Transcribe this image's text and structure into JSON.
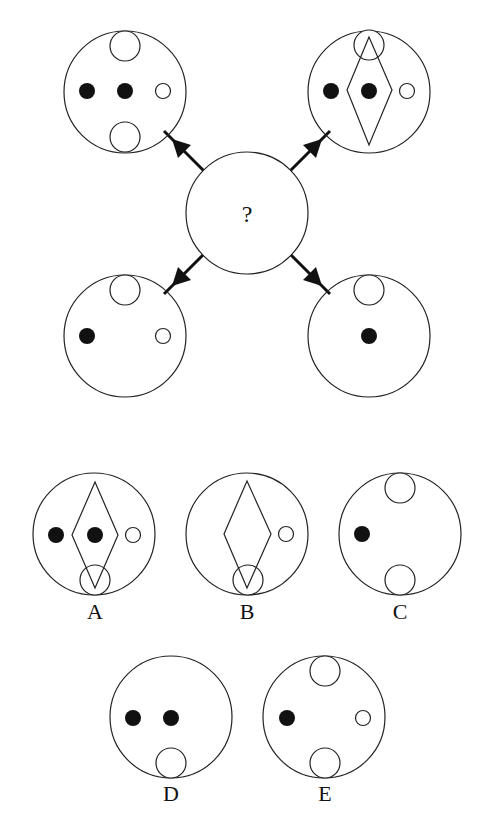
{
  "puzzle": {
    "center_label": "?",
    "colors": {
      "stroke": "#222222",
      "fill_dot": "#111111",
      "background": "#ffffff"
    },
    "question_figures": [
      {
        "id": "top-left",
        "elements": [
          "top-small-circle",
          "black-dot-left",
          "black-dot-center",
          "white-dot-right",
          "bottom-small-circle"
        ]
      },
      {
        "id": "top-right",
        "elements": [
          "top-small-circle",
          "diamond",
          "black-dot-left",
          "black-dot-center",
          "white-dot-right"
        ]
      },
      {
        "id": "bottom-left",
        "elements": [
          "top-small-circle",
          "black-dot-left",
          "white-dot-right"
        ]
      },
      {
        "id": "bottom-right",
        "elements": [
          "top-small-circle",
          "black-dot-center"
        ]
      }
    ],
    "options": [
      {
        "label": "A",
        "elements": [
          "diamond",
          "black-dot-left",
          "black-dot-center",
          "white-dot-right",
          "bottom-small-circle"
        ]
      },
      {
        "label": "B",
        "elements": [
          "diamond",
          "white-dot-right",
          "bottom-small-circle"
        ]
      },
      {
        "label": "C",
        "elements": [
          "top-small-circle",
          "black-dot-left",
          "bottom-small-circle"
        ]
      },
      {
        "label": "D",
        "elements": [
          "black-dot-left",
          "black-dot-center",
          "bottom-small-circle"
        ]
      },
      {
        "label": "E",
        "elements": [
          "top-small-circle",
          "black-dot-left",
          "white-dot-right",
          "bottom-small-circle"
        ]
      }
    ]
  }
}
